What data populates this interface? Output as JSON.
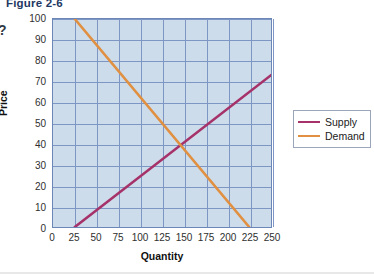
{
  "figure": {
    "title": "Figure 2-6",
    "stem_marker": "?"
  },
  "legend": {
    "position": "right",
    "items": [
      {
        "label": "Supply",
        "color": "#a6326a"
      },
      {
        "label": "Demand",
        "color": "#e09040"
      }
    ]
  },
  "axes": {
    "xlabel": "Quantity",
    "ylabel": "Price",
    "xticks": [
      "0",
      "25",
      "50",
      "75",
      "100",
      "125",
      "150",
      "175",
      "200",
      "225",
      "250"
    ],
    "yticks": [
      "100",
      "90",
      "80",
      "70",
      "60",
      "50",
      "40",
      "30",
      "20",
      "10",
      "0"
    ]
  },
  "colors": {
    "plot_background": "#cddcea",
    "gridline": "#7e96c4",
    "plot_border": "#6d86b8",
    "supply": "#a6326a",
    "demand": "#e09040",
    "title": "#1f3864"
  },
  "chart_data": {
    "type": "line",
    "title": "Figure 2-6",
    "xlabel": "Quantity",
    "ylabel": "Price",
    "xlim": [
      0,
      250
    ],
    "ylim": [
      0,
      100
    ],
    "xticks": [
      0,
      25,
      50,
      75,
      100,
      125,
      150,
      175,
      200,
      225,
      250
    ],
    "yticks": [
      0,
      10,
      20,
      30,
      40,
      50,
      60,
      70,
      80,
      90,
      100
    ],
    "grid": true,
    "legend_position": "right",
    "equilibrium": {
      "quantity": 150,
      "price": 40
    },
    "series": [
      {
        "name": "Supply",
        "color": "#a6326a",
        "x": [
          25,
          250
        ],
        "y": [
          0,
          73
        ]
      },
      {
        "name": "Demand",
        "color": "#e09040",
        "x": [
          25,
          225
        ],
        "y": [
          100,
          0
        ]
      }
    ]
  }
}
